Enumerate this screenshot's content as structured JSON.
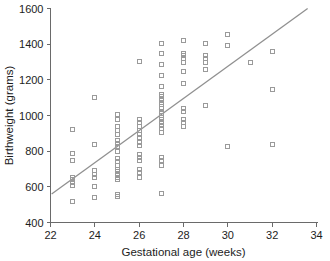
{
  "chart_data": {
    "type": "scatter",
    "title": "",
    "xlabel": "Gestational age (weeks)",
    "ylabel": "Birthweight (grams)",
    "xlim": [
      22,
      34
    ],
    "ylim": [
      400,
      1600
    ],
    "xticks": [
      22,
      24,
      26,
      28,
      30,
      32,
      34
    ],
    "yticks": [
      400,
      600,
      800,
      1000,
      1200,
      1400,
      1600
    ],
    "grid": false,
    "legend": null,
    "marker_style": "open-square",
    "marker_color": "#9a9a9a",
    "line_color": "#909090",
    "series": [
      {
        "name": "Births",
        "x": [
          23,
          23,
          23,
          23,
          23,
          23,
          23,
          23,
          24,
          24,
          24,
          24,
          24,
          24,
          24,
          25,
          25,
          25,
          25,
          25,
          25,
          25,
          25,
          25,
          25,
          25,
          25,
          25,
          25,
          25,
          25,
          25,
          25,
          25,
          26,
          26,
          26,
          26,
          26,
          26,
          26,
          26,
          26,
          26,
          26,
          26,
          26,
          26,
          26,
          27,
          27,
          27,
          27,
          27,
          27,
          27,
          27,
          27,
          27,
          27,
          27,
          27,
          27,
          27,
          27,
          27,
          27,
          27,
          27,
          27,
          27,
          27,
          27,
          28,
          28,
          28,
          28,
          28,
          28,
          28,
          28,
          28,
          28,
          28,
          28,
          29,
          29,
          29,
          29,
          29,
          29,
          30,
          30,
          30,
          31,
          32,
          32,
          32
        ],
        "y": [
          515,
          610,
          625,
          640,
          655,
          745,
          785,
          920,
          540,
          600,
          655,
          670,
          690,
          835,
          1100,
          545,
          555,
          640,
          655,
          670,
          685,
          700,
          720,
          740,
          760,
          800,
          825,
          845,
          860,
          895,
          915,
          940,
          975,
          1005,
          655,
          680,
          700,
          750,
          765,
          780,
          830,
          850,
          875,
          895,
          915,
          940,
          960,
          975,
          1305,
          560,
          720,
          750,
          765,
          905,
          925,
          945,
          960,
          975,
          990,
          1000,
          1010,
          1025,
          1040,
          1060,
          1075,
          1090,
          1105,
          1120,
          1165,
          1225,
          1285,
          1350,
          1405,
          940,
          960,
          980,
          1020,
          1040,
          1180,
          1245,
          1300,
          1320,
          1335,
          1350,
          1420,
          1055,
          1260,
          1300,
          1320,
          1335,
          1405,
          825,
          1395,
          1455,
          1300,
          840,
          1145,
          1360
        ]
      }
    ],
    "fit_line": {
      "name": "regression-line",
      "x": [
        22.05,
        33.6
      ],
      "y": [
        560,
        1600
      ]
    }
  },
  "axes": {
    "x_tick_labels": [
      "22",
      "24",
      "26",
      "28",
      "30",
      "32",
      "34"
    ],
    "y_tick_labels": [
      "400",
      "600",
      "800",
      "1000",
      "1200",
      "1400",
      "1600"
    ],
    "x_axis_title": "Gestational age (weeks)",
    "y_axis_title": "Birthweight (grams)"
  }
}
